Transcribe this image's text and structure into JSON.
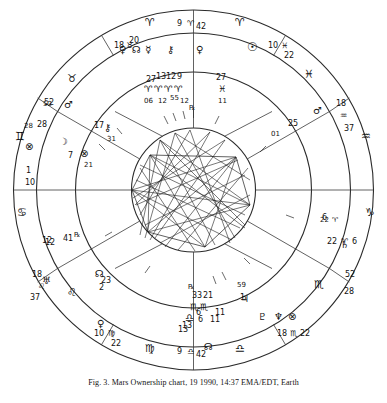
{
  "caption": "Fig. 3. Mars Ownership chart, 19 1990, 14:37 EMA/EDT, Earth",
  "chart": {
    "type": "astrological-natal-wheel",
    "colors": {
      "ink": "#1a1a1a",
      "line": "#333333",
      "aspect": "#222222",
      "background": "#ffffff"
    },
    "outer_ring_signs": [
      {
        "pos": "top",
        "glyph": "♈"
      },
      {
        "pos": "upper-right",
        "glyph": "♓"
      },
      {
        "pos": "right-upper",
        "glyph": "♒"
      },
      {
        "pos": "right",
        "glyph": "♑"
      },
      {
        "pos": "lower-right",
        "glyph": "♏"
      },
      {
        "pos": "bottom",
        "glyph": "♎"
      },
      {
        "pos": "lower-left",
        "glyph": "♌"
      },
      {
        "pos": "left",
        "glyph": "♋"
      },
      {
        "pos": "upper-left",
        "glyph": "♊"
      }
    ],
    "house_cusps": [
      {
        "label": "9",
        "glyph": "♈",
        "minutes": "42",
        "at": "top"
      },
      {
        "label": "10",
        "glyph": "♓",
        "minutes": "22",
        "at": "upper-right"
      },
      {
        "label": "18",
        "glyph": "♒",
        "minutes": "37",
        "at": "right-upper"
      },
      {
        "label": "22",
        "glyph": "♑",
        "minutes": "6",
        "at": "right"
      },
      {
        "label": "1",
        "glyph": "♐",
        "minutes": "28",
        "at": "right-lower"
      },
      {
        "label": "18",
        "glyph": "♏",
        "minutes": "22",
        "at": "lower-right"
      },
      {
        "label": "9",
        "glyph": "♎",
        "minutes": "42",
        "at": "bottom"
      },
      {
        "label": "10",
        "glyph": "♍",
        "minutes": "22",
        "at": "lower-left"
      },
      {
        "label": "18",
        "glyph": "♌",
        "minutes": "37",
        "at": "left-lower"
      },
      {
        "label": "1",
        "glyph": "♋",
        "minutes": "10",
        "at": "left"
      },
      {
        "label": "28",
        "glyph": "♊",
        "minutes": "52",
        "at": "left-upper"
      },
      {
        "label": "18",
        "glyph": "♉",
        "minutes": "20",
        "at": "upper-left"
      }
    ],
    "house_numbers": [
      {
        "n": "10",
        "at": "top"
      },
      {
        "n": "11",
        "at": "upper-right"
      },
      {
        "n": "12",
        "at": "right-upper"
      },
      {
        "n": "1",
        "at": "right"
      },
      {
        "n": "2",
        "at": "right-lower"
      },
      {
        "n": "3",
        "at": "lower-right"
      },
      {
        "n": "4",
        "at": "bottom"
      },
      {
        "n": "5",
        "at": "lower-left"
      },
      {
        "n": "6",
        "at": "left-lower"
      },
      {
        "n": "7",
        "at": "left"
      },
      {
        "n": "8",
        "at": "left-upper"
      },
      {
        "n": "9",
        "at": "upper-left"
      }
    ],
    "planets": [
      {
        "name": "sun",
        "glyph": "☉",
        "sign": "♈",
        "degree": "27",
        "minutes": "11"
      },
      {
        "name": "moon",
        "glyph": "☽",
        "sign": "♊",
        "degree": "7",
        "minutes": "21"
      },
      {
        "name": "mercury",
        "glyph": "☿",
        "sign": "♈",
        "degree": "27",
        "minutes": "06"
      },
      {
        "name": "venus",
        "glyph": "♀",
        "sign": "♈",
        "degree": "13",
        "minutes": "12"
      },
      {
        "name": "mars",
        "glyph": "♂",
        "sign": "♉",
        "degree": "52",
        "minutes": "28"
      },
      {
        "name": "jupiter",
        "glyph": "♃",
        "sign": "♏",
        "degree": "6",
        "minutes": "11"
      },
      {
        "name": "saturn",
        "glyph": "♄",
        "sign": "♑",
        "degree": "22",
        "minutes": "6"
      },
      {
        "name": "uranus",
        "glyph": "♅",
        "sign": "♐",
        "degree": "25",
        "minutes": "01"
      },
      {
        "name": "neptune",
        "glyph": "♆",
        "sign": "♏",
        "degree": "18",
        "minutes": "22"
      },
      {
        "name": "pluto",
        "glyph": "♇",
        "sign": "♏",
        "degree": "13",
        "minutes": "33"
      },
      {
        "name": "chiron",
        "glyph": "⚷",
        "sign": "♋",
        "degree": "17",
        "minutes": "31"
      },
      {
        "name": "node",
        "glyph": "☊",
        "sign": "♍",
        "degree": "2",
        "minutes": "23"
      },
      {
        "name": "part-fortune",
        "glyph": "⊗",
        "sign": "♎",
        "degree": "1",
        "minutes": "59"
      }
    ],
    "inner_labels": [
      {
        "text": "27",
        "x": 152,
        "y": 85
      },
      {
        "text": "13",
        "x": 166,
        "y": 82
      },
      {
        "text": "12",
        "x": 160,
        "y": 79
      },
      {
        "text": "9",
        "x": 178,
        "y": 82
      },
      {
        "text": "27",
        "x": 221,
        "y": 80
      },
      {
        "text": "11",
        "x": 222,
        "y": 100
      },
      {
        "text": "06",
        "x": 152,
        "y": 101
      },
      {
        "text": "12",
        "x": 164,
        "y": 101
      },
      {
        "text": "55",
        "x": 178,
        "y": 99
      },
      {
        "text": "12",
        "x": 190,
        "y": 101
      },
      {
        "text": "1",
        "x": 29,
        "y": 172
      },
      {
        "text": "10",
        "x": 27,
        "y": 182
      },
      {
        "text": "12",
        "x": 46,
        "y": 243
      },
      {
        "text": "41",
        "x": 68,
        "y": 243
      },
      {
        "text": "18",
        "x": 33,
        "y": 277
      },
      {
        "text": "37",
        "x": 30,
        "y": 293
      },
      {
        "text": "2",
        "x": 101,
        "y": 289
      },
      {
        "text": "23",
        "x": 104,
        "y": 279
      },
      {
        "text": "13",
        "x": 183,
        "y": 326
      },
      {
        "text": "6",
        "x": 196,
        "y": 314
      },
      {
        "text": "11",
        "x": 208,
        "y": 314
      },
      {
        "text": "33",
        "x": 196,
        "y": 289
      },
      {
        "text": "21",
        "x": 204,
        "y": 289
      },
      {
        "text": "1",
        "x": 243,
        "y": 299
      },
      {
        "text": "59",
        "x": 237,
        "y": 285
      },
      {
        "text": "52",
        "x": 349,
        "y": 277
      },
      {
        "text": "28",
        "x": 351,
        "y": 293
      },
      {
        "text": "1",
        "x": 346,
        "y": 120
      },
      {
        "text": "37",
        "x": 346,
        "y": 131
      },
      {
        "text": "25",
        "x": 292,
        "y": 124
      },
      {
        "text": "01",
        "x": 276,
        "y": 133
      },
      {
        "text": "52",
        "x": 46,
        "y": 104
      },
      {
        "text": "28",
        "x": 38,
        "y": 126
      },
      {
        "text": "20",
        "x": 202,
        "y": 46
      }
    ]
  }
}
